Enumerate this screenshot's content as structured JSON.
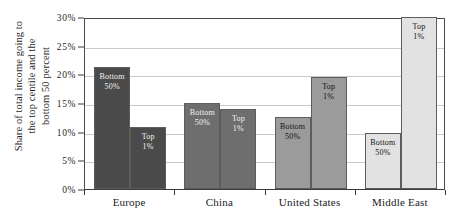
{
  "chart_data": {
    "type": "bar",
    "title": "",
    "subtitle": "",
    "xlabel": "",
    "ylabel": "Share of total income going to\nthe top centile and the\nbottom 50 percent",
    "ylim": [
      0,
      30
    ],
    "ytick_labels": [
      "0%",
      "5%",
      "10%",
      "15%",
      "20%",
      "25%",
      "30%"
    ],
    "ytick_values": [
      0,
      5,
      10,
      15,
      20,
      25,
      30
    ],
    "grid": true,
    "legend_position": "none",
    "categories": [
      "Europe",
      "China",
      "United States",
      "Middle East"
    ],
    "series": [
      {
        "name": "Bottom 50%",
        "label_line1": "Bottom",
        "label_line2": "50%",
        "values": [
          21.3,
          15.0,
          12.5,
          9.8
        ]
      },
      {
        "name": "Top 1%",
        "label_line1": "Top",
        "label_line2": "1%",
        "values": [
          10.8,
          14.0,
          19.5,
          30.0
        ]
      }
    ],
    "group_colors": [
      "#4a4a4a",
      "#6e6e6e",
      "#9b9b9b",
      "#e2e2e2"
    ],
    "group_label_text_colors": [
      "light",
      "light",
      "dark",
      "dark"
    ],
    "bar_border_color": "#5d5d5d",
    "axis_color": "#3a3a3a",
    "gridline_color": "#c9c9c9",
    "background_color": "#ffffff",
    "bar_labels": [
      [
        {
          "group": "Europe",
          "series": "Bottom 50%",
          "line1": "Bottom",
          "line2": "50%"
        },
        {
          "group": "Europe",
          "series": "Top 1%",
          "line1": "Top",
          "line2": "1%"
        }
      ],
      [
        {
          "group": "China",
          "series": "Bottom 50%",
          "line1": "Bottom",
          "line2": "50%"
        },
        {
          "group": "China",
          "series": "Top 1%",
          "line1": "Top",
          "line2": "1%"
        }
      ],
      [
        {
          "group": "United States",
          "series": "Bottom 50%",
          "line1": "Bottom",
          "line2": "50%"
        },
        {
          "group": "United States",
          "series": "Top 1%",
          "line1": "Top",
          "line2": "1%"
        }
      ],
      [
        {
          "group": "Middle East",
          "series": "Bottom 50%",
          "line1": "Bottom",
          "line2": "50%"
        },
        {
          "group": "Middle East",
          "series": "Top 1%",
          "line1": "Top",
          "line2": "1%"
        }
      ]
    ]
  }
}
